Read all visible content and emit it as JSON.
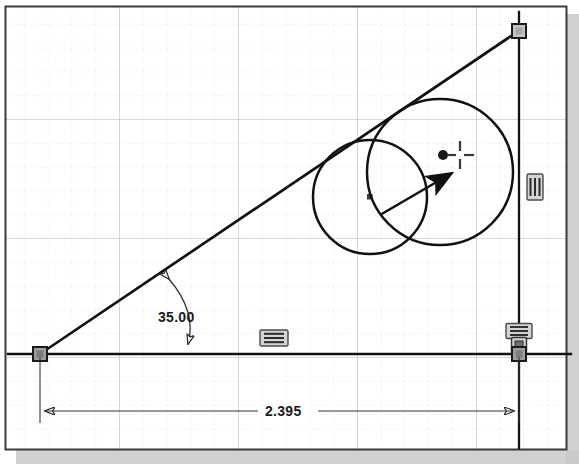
{
  "application": {
    "type": "cad-sketch-editor",
    "view": "2d-sketch-plane"
  },
  "canvas": {
    "width": 579,
    "height": 468,
    "background_color": "#ffffff",
    "border_color": "#333333",
    "shadow_color": "#b0b0b0"
  },
  "grid": {
    "visible": true,
    "minor_spacing_px": 23.8,
    "major_spacing_px": 119,
    "minor_color": "#d8d8d8",
    "major_color": "#bdbdbd",
    "style": "dotted"
  },
  "geometry": {
    "origin_point": {
      "name": "origin",
      "x": 40,
      "y": 354,
      "marker": "fixed-square"
    },
    "horizontal_line": {
      "name": "base-line",
      "x1": 8,
      "y1": 354,
      "x2": 571,
      "y2": 354,
      "color": "#111111",
      "width": 2.2
    },
    "vertical_line": {
      "name": "right-line",
      "x1": 519,
      "y1": 12,
      "x2": 519,
      "y2": 446,
      "color": "#111111",
      "width": 2.2
    },
    "angled_line": {
      "name": "angled-line",
      "x1": 40,
      "y1": 354,
      "x2": 519,
      "y2": 31,
      "color": "#111111",
      "width": 2.6
    },
    "top_vertex": {
      "name": "top-vertex",
      "x": 519,
      "y": 31,
      "marker": "endpoint-square"
    },
    "bottom_right_vertex": {
      "name": "bottom-right-vertex",
      "x": 519,
      "y": 354,
      "marker": "endpoint-square"
    },
    "circles": [
      {
        "name": "circle-small",
        "cx": 370,
        "cy": 197,
        "r": 57,
        "center_marker": "small-square",
        "color": "#111111",
        "width": 2.4
      },
      {
        "name": "circle-large",
        "cx": 440,
        "cy": 172,
        "r": 73,
        "center_marker": "filled-dot",
        "color": "#111111",
        "width": 2.4
      }
    ]
  },
  "dimensions": {
    "angular": {
      "label": "35.00",
      "value": 35.0,
      "unit": "degrees",
      "text_x": 160,
      "text_y": 322,
      "arc": {
        "from_x": 168,
        "from_y": 277,
        "to_x": 188,
        "to_y": 347,
        "ctrl_x": 196,
        "ctrl_y": 312
      }
    },
    "linear": {
      "label": "2.395",
      "value": 2.395,
      "unit": "inches",
      "text_x": 268,
      "text_y": 416,
      "line_y": 410,
      "x1": 40,
      "x2": 519,
      "ext_top_y": 357
    }
  },
  "constraints": [
    {
      "name": "vertical-constraint",
      "symbol": "vertical",
      "x": 535,
      "y": 187
    },
    {
      "name": "horizontal-constraint-mid",
      "symbol": "horizontal",
      "x": 274,
      "y": 338
    },
    {
      "name": "horizontal-constraint-right",
      "symbol": "horizontal",
      "x": 519,
      "y": 332
    },
    {
      "name": "coincident-constraint-right",
      "symbol": "coincident",
      "x": 519,
      "y": 347
    }
  ],
  "cursor": {
    "name": "crosshair-cursor",
    "x": 460,
    "y": 155,
    "dot_x": 443,
    "dot_y": 155,
    "type": "drag-point"
  },
  "drag_arrow": {
    "name": "drag-direction-arrow",
    "x1": 382,
    "y1": 213,
    "x2": 456,
    "y2": 170,
    "color": "#111111"
  }
}
